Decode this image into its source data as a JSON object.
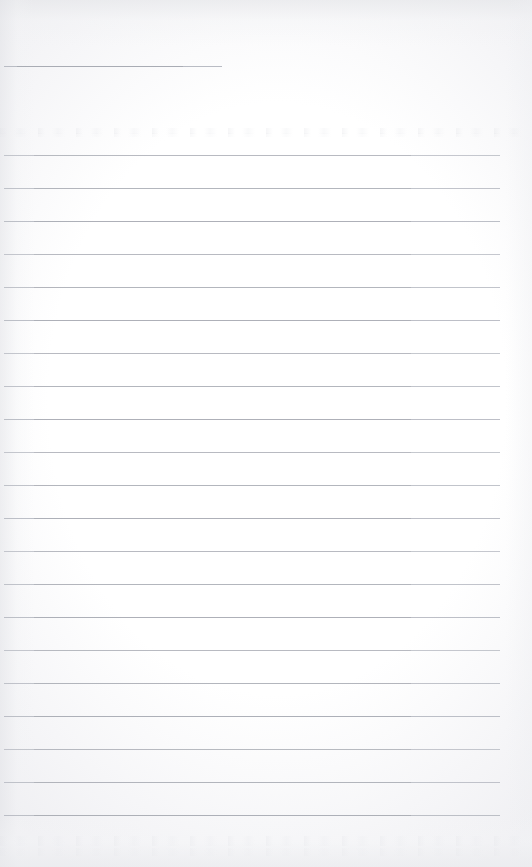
{
  "document": {
    "kind": "scanned-lined-paper",
    "title": "",
    "visible_text": "",
    "page_width": 532,
    "page_height": 867
  },
  "palette": {
    "paper": "#fdfdfe",
    "paper_edge_shadow": "#e4e5e8",
    "rule_line": "#b9bcc4",
    "rule_line_dark": "#96999f"
  },
  "header_rule": {
    "name": "top-short-rule",
    "x": 4,
    "y": 66,
    "width": 218,
    "thickness": 1
  },
  "body_rules": {
    "name": "ruled-lines",
    "count": 21,
    "left": 4,
    "right": 500,
    "first_y": 155,
    "spacing": 33,
    "thickness": 1,
    "y_positions": [
      155,
      188,
      221,
      254,
      287,
      320,
      353,
      386,
      419,
      452,
      485,
      518,
      551,
      584,
      617,
      650,
      683,
      716,
      749,
      782,
      815
    ]
  },
  "texture": {
    "smudge_bands": [
      {
        "y": 128,
        "height": 6,
        "opacity": 0.35
      },
      {
        "y": 133,
        "height": 4,
        "opacity": 0.22
      },
      {
        "y": 836,
        "height": 10,
        "opacity": 0.3
      },
      {
        "y": 848,
        "height": 8,
        "opacity": 0.22
      }
    ]
  }
}
